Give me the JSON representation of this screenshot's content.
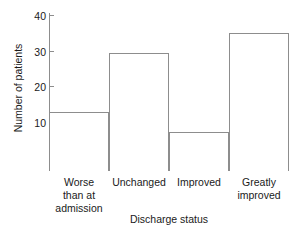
{
  "chart_data": {
    "type": "bar",
    "title": "",
    "subtitle": "",
    "xlabel": "Discharge status",
    "ylabel": "Number of patients",
    "categories": [
      "Worse than at admission",
      "Unchanged",
      "Improved",
      "Greatly improved"
    ],
    "category_lines": [
      [
        "Worse",
        "than at",
        "admission"
      ],
      [
        "Unchanged"
      ],
      [
        "Improved"
      ],
      [
        "Greatly",
        "improved"
      ]
    ],
    "values": [
      15,
      30,
      10,
      35
    ],
    "ylim": [
      0,
      40
    ],
    "yticks": [
      10,
      20,
      30,
      40
    ],
    "ytick_labels": [
      "10",
      "20",
      "30",
      "40"
    ],
    "grid": false,
    "legend": null,
    "bar_style": {
      "fill": "#ffffff",
      "stroke": "#8d8d8d",
      "gap": 0
    },
    "axis_color": "#8d8d8d",
    "text_color": "#1a1a1a"
  }
}
